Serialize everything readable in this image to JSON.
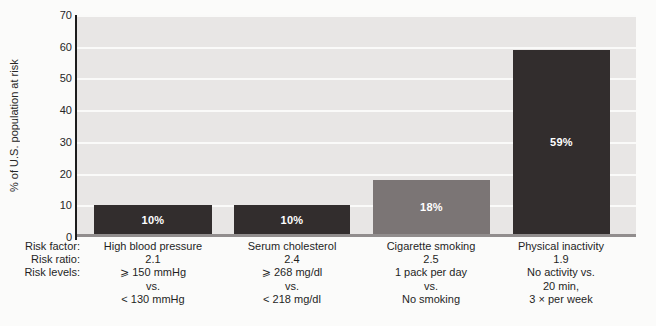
{
  "chart_data": {
    "type": "bar",
    "title": "",
    "ylabel": "% of U.S. population at risk",
    "xlabel": "",
    "ylim": [
      0,
      70
    ],
    "yticks": [
      70,
      60,
      50,
      40,
      30,
      20,
      10,
      0
    ],
    "grid": true,
    "legend_position": "none",
    "categories": [
      "High blood pressure",
      "Serum cholesterol",
      "Cigarette smoking",
      "Physical inactivity"
    ],
    "values": [
      10,
      10,
      18,
      59
    ],
    "value_labels": [
      "10%",
      "10%",
      "18%",
      "59%"
    ],
    "bar_colors": [
      "#322d2d",
      "#322d2d",
      "#7b7575",
      "#322d2d"
    ],
    "value_label_color": "#ffffff",
    "plot_background": "#e8e6e5",
    "gridline_color": "#fafaf9",
    "axis_color": "#1c1c1c",
    "baseline_color": "#918d8d"
  },
  "footer": {
    "row_labels": [
      "Risk factor:",
      "Risk ratio:",
      "Risk levels:"
    ],
    "columns": [
      {
        "risk_factor": "High blood pressure",
        "risk_ratio": "2.1",
        "risk_levels": [
          "⩾ 150 mmHg",
          "vs.",
          "< 130 mmHg"
        ]
      },
      {
        "risk_factor": "Serum cholesterol",
        "risk_ratio": "2.4",
        "risk_levels": [
          "⩾ 268 mg/dl",
          "vs.",
          "< 218 mg/dl"
        ]
      },
      {
        "risk_factor": "Cigarette smoking",
        "risk_ratio": "2.5",
        "risk_levels": [
          "1 pack per day",
          "vs.",
          "No smoking"
        ]
      },
      {
        "risk_factor": "Physical inactivity",
        "risk_ratio": "1.9",
        "risk_levels": [
          "No activity vs.",
          "20 min,",
          "3 × per week"
        ]
      }
    ]
  }
}
